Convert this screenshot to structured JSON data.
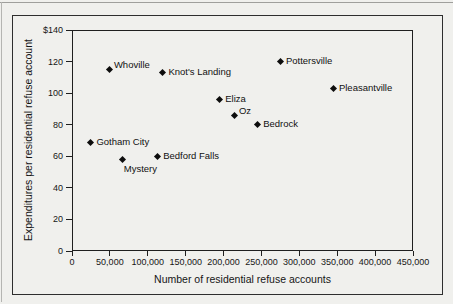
{
  "figure": {
    "background": "#f0f0ed",
    "border_color": "#2e2e2e",
    "text_color": "#161616",
    "marker_color": "#0d0d0d",
    "marker_shape": "diamond"
  },
  "chart_data": {
    "type": "scatter",
    "title": "",
    "xlabel": "Number of residential refuse accounts",
    "ylabel": "Expenditures per residential refuse account",
    "xlim": [
      0,
      450000
    ],
    "ylim": [
      0,
      140
    ],
    "x_tick_step": 50000,
    "y_tick_step": 20,
    "x_tick_labels": [
      "0",
      "50,000",
      "100,000",
      "150,000",
      "200,000",
      "250,000",
      "300,000",
      "350,000",
      "400,000",
      "450,000"
    ],
    "y_tick_labels": [
      "0",
      "20",
      "40",
      "60",
      "80",
      "100",
      "120",
      "$140"
    ],
    "grid": false,
    "legend": "none",
    "points": [
      {
        "label": "Whoville",
        "x": 50000,
        "y": 115,
        "label_pos": "above-right"
      },
      {
        "label": "Knot's Landing",
        "x": 120000,
        "y": 113,
        "label_pos": "right"
      },
      {
        "label": "Pottersville",
        "x": 275000,
        "y": 120,
        "label_pos": "right"
      },
      {
        "label": "Pleasantville",
        "x": 345000,
        "y": 103,
        "label_pos": "right"
      },
      {
        "label": "Eliza",
        "x": 195000,
        "y": 96,
        "label_pos": "right"
      },
      {
        "label": "Oz",
        "x": 215000,
        "y": 86,
        "label_pos": "above-right"
      },
      {
        "label": "Bedrock",
        "x": 245000,
        "y": 80,
        "label_pos": "right"
      },
      {
        "label": "Gotham City",
        "x": 25000,
        "y": 69,
        "label_pos": "right"
      },
      {
        "label": "Mystery",
        "x": 67000,
        "y": 58,
        "label_pos": "below"
      },
      {
        "label": "Bedford Falls",
        "x": 113000,
        "y": 60,
        "label_pos": "right"
      }
    ]
  }
}
